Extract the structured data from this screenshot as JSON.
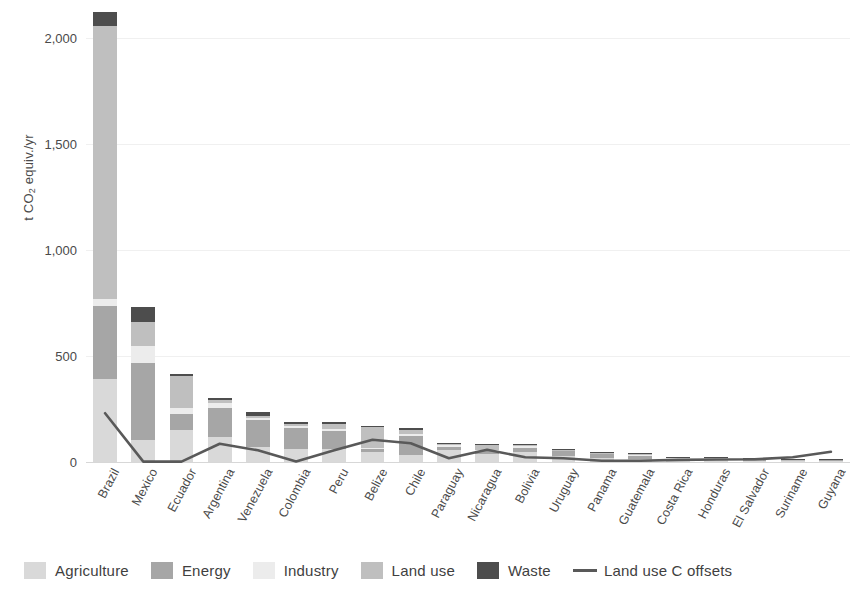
{
  "chart_data": {
    "type": "bar",
    "title": "",
    "subtitle": "",
    "xlabel": "",
    "ylabel": "t CO2 equiv./yr",
    "ylabel_parts": {
      "pre": "t CO",
      "sub": "2",
      "post": " equiv./yr"
    },
    "ylim": [
      0,
      2150
    ],
    "yticks": [
      0,
      500,
      1000,
      1500,
      2000
    ],
    "ytick_labels": [
      "0",
      "500",
      "1,000",
      "1,500",
      "2,000"
    ],
    "grid": "horizontal-light",
    "stacked": true,
    "legend_position": "bottom",
    "categories": [
      "Brazil",
      "Mexico",
      "Ecuador",
      "Argentina",
      "Venezuela",
      "Colombia",
      "Peru",
      "Belize",
      "Chile",
      "Paraguay",
      "Nicaragua",
      "Bolivia",
      "Uruguay",
      "Panama",
      "Guatemala",
      "Costa Rica",
      "Honduras",
      "El Salvador",
      "Suriname",
      "Guyana"
    ],
    "series": [
      {
        "name": "Agriculture",
        "color": "#d9d9d9",
        "values": [
          390,
          105,
          150,
          120,
          70,
          60,
          60,
          45,
          35,
          55,
          38,
          48,
          30,
          18,
          16,
          10,
          11,
          6,
          5,
          6
        ]
      },
      {
        "name": "Energy",
        "color": "#a6a6a6",
        "values": [
          345,
          360,
          75,
          135,
          130,
          100,
          85,
          15,
          90,
          18,
          16,
          20,
          22,
          20,
          12,
          8,
          7,
          8,
          4,
          5
        ]
      },
      {
        "name": "Industry",
        "color": "#ececec",
        "values": [
          35,
          80,
          30,
          22,
          8,
          10,
          12,
          8,
          8,
          6,
          4,
          6,
          4,
          4,
          3,
          2,
          2,
          2,
          1,
          1
        ]
      },
      {
        "name": "Land use",
        "color": "#bfbfbf",
        "values": [
          1285,
          115,
          150,
          15,
          10,
          8,
          20,
          95,
          20,
          8,
          22,
          10,
          2,
          2,
          8,
          2,
          2,
          1,
          1,
          1
        ]
      },
      {
        "name": "Waste",
        "color": "#4d4d4d",
        "values": [
          65,
          70,
          8,
          12,
          20,
          12,
          10,
          6,
          8,
          4,
          3,
          3,
          3,
          3,
          2,
          2,
          1,
          1,
          1,
          1
        ]
      }
    ],
    "line_series": {
      "name": "Land use C offsets",
      "color": "#595959",
      "values": [
        230,
        2,
        2,
        86,
        55,
        3,
        55,
        105,
        88,
        18,
        58,
        22,
        18,
        6,
        6,
        10,
        12,
        13,
        22,
        48
      ]
    }
  },
  "legend": {
    "items": [
      {
        "label": "Agriculture",
        "type": "swatch",
        "color": "#d9d9d9"
      },
      {
        "label": "Energy",
        "type": "swatch",
        "color": "#a6a6a6"
      },
      {
        "label": "Industry",
        "type": "swatch",
        "color": "#ececec"
      },
      {
        "label": "Land use",
        "type": "swatch",
        "color": "#bfbfbf"
      },
      {
        "label": "Waste",
        "type": "swatch",
        "color": "#4d4d4d"
      },
      {
        "label": "Land use C offsets",
        "type": "line",
        "color": "#595959"
      }
    ]
  }
}
